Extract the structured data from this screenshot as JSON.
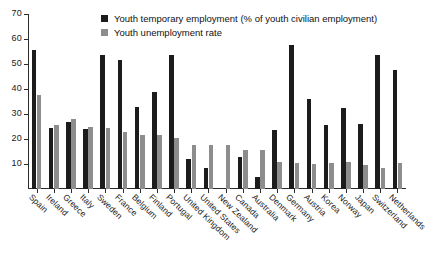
{
  "chart_data": {
    "type": "bar",
    "title": "",
    "xlabel": "",
    "ylabel": "",
    "ylim": [
      0,
      70
    ],
    "yticks": [
      0,
      10,
      20,
      30,
      40,
      50,
      60,
      70
    ],
    "grid": false,
    "legend_position": "top-center",
    "categories": [
      "Spain",
      "Ireland",
      "Greece",
      "Italy",
      "Sweden",
      "France",
      "Belgium",
      "Finland",
      "Portugal",
      "United Kingdom",
      "United States",
      "New Zealand",
      "Canada",
      "Australia",
      "Denmark",
      "Germany",
      "Austria",
      "Korea",
      "Norway",
      "Japan",
      "Switzerland",
      "Netherlands"
    ],
    "series": [
      {
        "name": "Youth temporary employment (% of youth civilian employment)",
        "color": "#1c1c1c",
        "values": [
          55.8,
          24.5,
          27.0,
          24.0,
          53.5,
          51.5,
          33.0,
          39.0,
          53.5,
          12.0,
          8.5,
          null,
          13.0,
          5.0,
          23.5,
          57.5,
          36.0,
          25.5,
          32.5,
          26.0,
          53.5,
          47.5
        ]
      },
      {
        "name": "Youth unemployment rate",
        "color": "#8d8d8d",
        "values": [
          37.8,
          25.5,
          28.0,
          25.0,
          24.5,
          23.0,
          21.5,
          21.5,
          20.5,
          17.5,
          17.5,
          17.5,
          15.5,
          15.5,
          11.0,
          10.5,
          10.0,
          10.5,
          11.0,
          9.5,
          8.5,
          10.5
        ]
      }
    ]
  },
  "legend": {
    "items": [
      {
        "label": "Youth temporary employment (% of youth civilian employment)",
        "color": "#1c1c1c"
      },
      {
        "label": "Youth unemployment rate",
        "color": "#8d8d8d"
      }
    ]
  }
}
